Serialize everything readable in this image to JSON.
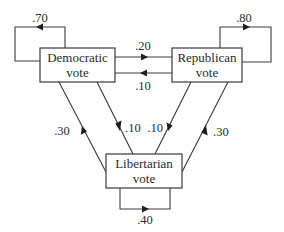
{
  "diagram": {
    "type": "transition-diagram",
    "nodes": [
      {
        "id": "democratic",
        "label_line1": "Democratic",
        "label_line2": "vote"
      },
      {
        "id": "republican",
        "label_line1": "Republican",
        "label_line2": "vote"
      },
      {
        "id": "libertarian",
        "label_line1": "Libertarian",
        "label_line2": "vote"
      }
    ],
    "edges": [
      {
        "from": "democratic",
        "to": "democratic",
        "label": ".70"
      },
      {
        "from": "republican",
        "to": "republican",
        "label": ".80"
      },
      {
        "from": "libertarian",
        "to": "libertarian",
        "label": ".40"
      },
      {
        "from": "democratic",
        "to": "republican",
        "label": ".20"
      },
      {
        "from": "republican",
        "to": "democratic",
        "label": ".10"
      },
      {
        "from": "democratic",
        "to": "libertarian",
        "label": ".10"
      },
      {
        "from": "libertarian",
        "to": "democratic",
        "label": ".30"
      },
      {
        "from": "republican",
        "to": "libertarian",
        "label": ".10"
      },
      {
        "from": "libertarian",
        "to": "republican",
        "label": ".30"
      }
    ]
  }
}
